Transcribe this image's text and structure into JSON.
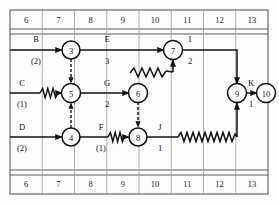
{
  "timescale": {
    "top_row_label": "time-axis-top",
    "bottom_row_label": "time-axis-bottom",
    "ticks": [
      "6",
      "7",
      "8",
      "9",
      "10",
      "11",
      "12",
      "13"
    ]
  },
  "nodes": [
    {
      "id": "n3",
      "label": "3",
      "x": 71,
      "y": 50
    },
    {
      "id": "n5",
      "label": "5",
      "x": 71,
      "y": 93
    },
    {
      "id": "n4",
      "label": "4",
      "x": 71,
      "y": 137
    },
    {
      "id": "n6",
      "label": "6",
      "x": 138,
      "y": 93
    },
    {
      "id": "n8",
      "label": "8",
      "x": 138,
      "y": 137
    },
    {
      "id": "n7",
      "label": "7",
      "x": 173,
      "y": 50
    },
    {
      "id": "n9",
      "label": "9",
      "x": 237,
      "y": 93
    },
    {
      "id": "n10",
      "label": "10",
      "x": 266,
      "y": 93
    }
  ],
  "activities": [
    {
      "id": "B",
      "name": "B",
      "duration": "(2)",
      "name_x": 36,
      "name_y": 39,
      "dur_x": 36,
      "dur_y": 61
    },
    {
      "id": "C",
      "name": "C",
      "duration": "(1)",
      "name_x": 22,
      "name_y": 83,
      "dur_x": 22,
      "dur_y": 104
    },
    {
      "id": "D",
      "name": "D",
      "duration": "(2)",
      "name_x": 22,
      "name_y": 127,
      "dur_x": 22,
      "dur_y": 148
    },
    {
      "id": "E",
      "name": "E",
      "duration": "3",
      "name_x": 107,
      "name_y": 39,
      "dur_x": 107,
      "dur_y": 61
    },
    {
      "id": "G",
      "name": "G",
      "duration": "2",
      "name_x": 107,
      "name_y": 83,
      "dur_x": 107,
      "dur_y": 104
    },
    {
      "id": "F",
      "name": "F",
      "duration": "(1)",
      "name_x": 101,
      "name_y": 127,
      "dur_x": 101,
      "dur_y": 148
    },
    {
      "id": "I",
      "name": "I",
      "duration": "2",
      "name_x": 190,
      "name_y": 39,
      "dur_x": 190,
      "dur_y": 61
    },
    {
      "id": "J",
      "name": "J",
      "duration": "1",
      "name_x": 160,
      "name_y": 127,
      "dur_x": 160,
      "dur_y": 148
    },
    {
      "id": "K",
      "name": "K",
      "duration": "1",
      "name_x": 251,
      "name_y": 83,
      "dur_x": 251,
      "dur_y": 104
    }
  ],
  "colors": {
    "line": "#111111",
    "grid": "#9a9a9a",
    "frame": "#5a5a5a",
    "background": "#ffffff"
  }
}
